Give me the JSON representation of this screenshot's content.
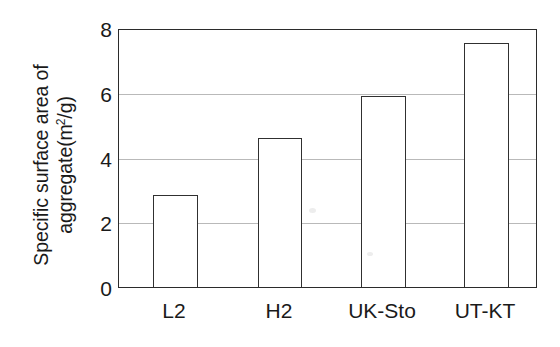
{
  "chart_data": {
    "type": "bar",
    "title": "",
    "subtitle": "",
    "xlabel": "",
    "ylabel_lines": [
      "Specific surface area of",
      "aggregate(m²/g)"
    ],
    "ylabel": "Specific surface area of aggregate(m²/g)",
    "ylabel_line1": "Specific surface area of",
    "ylabel_line2_pre": "aggregate(m",
    "ylabel_line2_sup": "2",
    "ylabel_line2_post": "/g)",
    "categories": [
      "L2",
      "H2",
      "UK-Sto",
      "UT-KT"
    ],
    "values": [
      2.85,
      4.65,
      5.95,
      7.6
    ],
    "series": [
      {
        "name": "Specific surface area of aggregate",
        "values": [
          2.85,
          4.65,
          5.95,
          7.6
        ]
      }
    ],
    "ylim": [
      0,
      8
    ],
    "yticks": [
      0,
      2,
      4,
      6,
      8
    ],
    "ytick_labels": [
      "0",
      "2",
      "4",
      "6",
      "8"
    ],
    "xtick_labels": [
      "L2",
      "H2",
      "UK-Sto",
      "UT-KT"
    ],
    "grid": "horizontal",
    "gridline_values": [
      2,
      4,
      6
    ],
    "legend": "none",
    "legend_position": "none",
    "units": "m²/g",
    "bar_fill_color": "#ffffff",
    "bar_edge_color": "#303030",
    "gridline_color": "#b9b9b9",
    "axis_color": "#2b2b2b",
    "background_color": "#ffffff",
    "text_color": "#1a1a1a",
    "annotations": []
  }
}
